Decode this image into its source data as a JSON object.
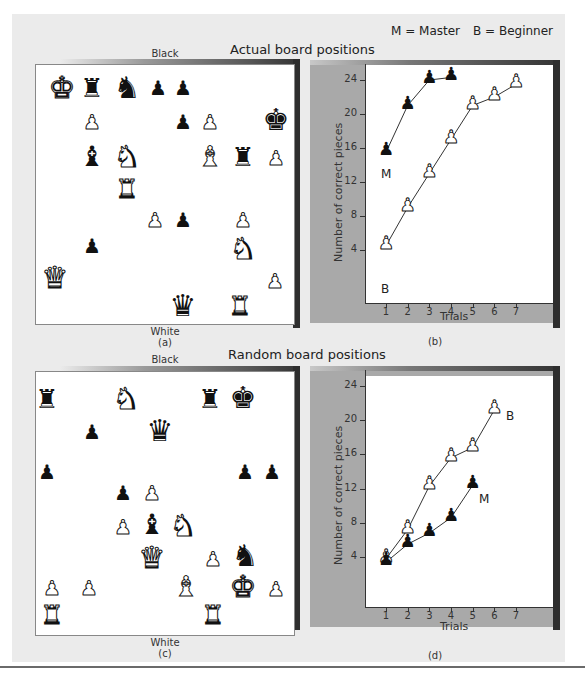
{
  "legend": {
    "master": "M = Master",
    "beginner": "B = Beginner"
  },
  "sections": {
    "actual_title": "Actual board positions",
    "random_title": "Random board positions"
  },
  "boards": {
    "a": {
      "top_label": "Black",
      "bottom_label": "White",
      "caption": "(a)",
      "pieces": [
        {
          "type": "king",
          "color": "white",
          "x": 62,
          "y": 88
        },
        {
          "type": "rook",
          "color": "black",
          "x": 92,
          "y": 88
        },
        {
          "type": "knight",
          "color": "black",
          "x": 127,
          "y": 88
        },
        {
          "type": "pawn",
          "color": "black",
          "x": 158,
          "y": 88
        },
        {
          "type": "pawn",
          "color": "black",
          "x": 183,
          "y": 88
        },
        {
          "type": "pawn",
          "color": "white",
          "x": 92,
          "y": 122
        },
        {
          "type": "pawn",
          "color": "black",
          "x": 183,
          "y": 122
        },
        {
          "type": "pawn",
          "color": "white",
          "x": 210,
          "y": 122
        },
        {
          "type": "king",
          "color": "black",
          "x": 276,
          "y": 120
        },
        {
          "type": "bishop",
          "color": "black",
          "x": 92,
          "y": 157
        },
        {
          "type": "knight",
          "color": "white",
          "x": 127,
          "y": 157
        },
        {
          "type": "bishop",
          "color": "white",
          "x": 210,
          "y": 157
        },
        {
          "type": "rook",
          "color": "black",
          "x": 243,
          "y": 157
        },
        {
          "type": "pawn",
          "color": "white",
          "x": 276,
          "y": 158
        },
        {
          "type": "rook",
          "color": "white",
          "x": 127,
          "y": 189
        },
        {
          "type": "pawn",
          "color": "white",
          "x": 155,
          "y": 220
        },
        {
          "type": "pawn",
          "color": "black",
          "x": 183,
          "y": 220
        },
        {
          "type": "pawn",
          "color": "white",
          "x": 243,
          "y": 220
        },
        {
          "type": "pawn",
          "color": "black",
          "x": 92,
          "y": 246
        },
        {
          "type": "knight",
          "color": "white",
          "x": 243,
          "y": 249
        },
        {
          "type": "queen",
          "color": "white",
          "x": 55,
          "y": 278
        },
        {
          "type": "pawn",
          "color": "white",
          "x": 275,
          "y": 281
        },
        {
          "type": "queen",
          "color": "black",
          "x": 183,
          "y": 306
        },
        {
          "type": "rook",
          "color": "white",
          "x": 240,
          "y": 306
        }
      ]
    },
    "c": {
      "top_label": "Black",
      "bottom_label": "White",
      "caption": "(c)",
      "pieces": [
        {
          "type": "rook",
          "color": "black",
          "x": 47,
          "y": 399
        },
        {
          "type": "knight",
          "color": "white",
          "x": 126,
          "y": 399
        },
        {
          "type": "rook",
          "color": "black",
          "x": 210,
          "y": 399
        },
        {
          "type": "king",
          "color": "black",
          "x": 243,
          "y": 398
        },
        {
          "type": "pawn",
          "color": "black",
          "x": 92,
          "y": 432
        },
        {
          "type": "queen",
          "color": "black",
          "x": 160,
          "y": 431
        },
        {
          "type": "pawn",
          "color": "black",
          "x": 47,
          "y": 472
        },
        {
          "type": "pawn",
          "color": "black",
          "x": 245,
          "y": 472
        },
        {
          "type": "pawn",
          "color": "black",
          "x": 272,
          "y": 472
        },
        {
          "type": "pawn",
          "color": "black",
          "x": 123,
          "y": 493
        },
        {
          "type": "pawn",
          "color": "white",
          "x": 152,
          "y": 493
        },
        {
          "type": "pawn",
          "color": "white",
          "x": 123,
          "y": 527
        },
        {
          "type": "bishop",
          "color": "black",
          "x": 152,
          "y": 525
        },
        {
          "type": "knight",
          "color": "white",
          "x": 183,
          "y": 526
        },
        {
          "type": "queen",
          "color": "white",
          "x": 152,
          "y": 558
        },
        {
          "type": "pawn",
          "color": "white",
          "x": 213,
          "y": 559
        },
        {
          "type": "knight",
          "color": "black",
          "x": 245,
          "y": 556
        },
        {
          "type": "pawn",
          "color": "white",
          "x": 52,
          "y": 588
        },
        {
          "type": "pawn",
          "color": "white",
          "x": 89,
          "y": 588
        },
        {
          "type": "bishop",
          "color": "white",
          "x": 186,
          "y": 587
        },
        {
          "type": "king",
          "color": "white",
          "x": 243,
          "y": 587
        },
        {
          "type": "pawn",
          "color": "white",
          "x": 276,
          "y": 589
        },
        {
          "type": "rook",
          "color": "white",
          "x": 52,
          "y": 615
        },
        {
          "type": "rook",
          "color": "white",
          "x": 213,
          "y": 615
        }
      ]
    }
  },
  "glyphs": {
    "king": "♚",
    "queen": "♛",
    "rook": "♜",
    "bishop": "♝",
    "knight": "♞",
    "pawn": "♟"
  },
  "chart_data": [
    {
      "type": "line",
      "panel": "(b)",
      "title": "Actual board positions",
      "xlabel": "Trials",
      "ylabel": "Number of correct pieces",
      "x": [
        1,
        2,
        3,
        4,
        5,
        6,
        7
      ],
      "xticks": [
        "1",
        "2",
        "3",
        "4",
        "5",
        "6",
        "7"
      ],
      "yticks": [
        "4",
        "8",
        "12",
        "16",
        "20",
        "24"
      ],
      "ylim": [
        1,
        25
      ],
      "grid": false,
      "series": [
        {
          "name": "M",
          "label": "Master",
          "marker": "black-pawn",
          "x": [
            1,
            2,
            3,
            4
          ],
          "values": [
            15.5,
            21,
            24,
            24.3
          ]
        },
        {
          "name": "B",
          "label": "Beginner",
          "marker": "white-pawn",
          "x": [
            1,
            2,
            3,
            4,
            5,
            6,
            7
          ],
          "values": [
            4.5,
            9,
            13,
            17,
            21,
            22,
            23.5
          ]
        }
      ]
    },
    {
      "type": "line",
      "panel": "(d)",
      "title": "Random board positions",
      "xlabel": "Trials",
      "ylabel": "Number of correct pieces",
      "x": [
        1,
        2,
        3,
        4,
        5,
        6,
        7
      ],
      "xticks": [
        "1",
        "2",
        "3",
        "4",
        "5",
        "6",
        "7"
      ],
      "yticks": [
        "4",
        "8",
        "12",
        "16",
        "20",
        "24"
      ],
      "ylim": [
        1,
        25
      ],
      "grid": false,
      "series": [
        {
          "name": "B",
          "label": "Beginner",
          "marker": "white-pawn",
          "x": [
            1,
            2,
            3,
            4,
            5,
            6
          ],
          "values": [
            3.8,
            7.2,
            12.3,
            15.6,
            16.8,
            21.2
          ]
        },
        {
          "name": "M",
          "label": "Master",
          "marker": "black-pawn",
          "x": [
            1,
            2,
            3,
            4,
            5
          ],
          "values": [
            3.4,
            5.5,
            6.8,
            8.6,
            12.4
          ]
        }
      ]
    }
  ],
  "charts": {
    "b": {
      "caption": "(b)",
      "ylabel": "Number of correct pieces",
      "xlabel": "Trials",
      "label_m": "M",
      "label_b": "B"
    },
    "d": {
      "caption": "(d)",
      "ylabel": "Number of correct pieces",
      "xlabel": "Trials",
      "label_m": "M",
      "label_b": "B"
    }
  }
}
